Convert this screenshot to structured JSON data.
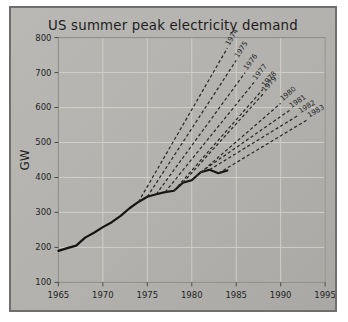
{
  "figure": {
    "title": "US summer peak electricity demand",
    "background_color": "#b5b4b0",
    "border_color": "#6f6f6d"
  },
  "chart_data": {
    "type": "line",
    "title": "US summer peak electricity demand",
    "xlabel": "",
    "ylabel": "GW",
    "xlim": [
      1965,
      1995
    ],
    "ylim": [
      100,
      800
    ],
    "xticks": [
      "1965",
      "1970",
      "1975",
      "1980",
      "1985",
      "1990",
      "1995"
    ],
    "yticks": [
      "100",
      "200",
      "300",
      "400",
      "500",
      "600",
      "700",
      "800"
    ],
    "grid": true,
    "legend": "none",
    "series": [
      {
        "name": "Actual demand",
        "style": "solid",
        "x": [
          1965,
          1966,
          1967,
          1968,
          1969,
          1970,
          1971,
          1972,
          1973,
          1974,
          1975,
          1976,
          1977,
          1978,
          1979,
          1980,
          1981,
          1982,
          1983,
          1984
        ],
        "values": [
          190,
          198,
          205,
          228,
          242,
          258,
          272,
          290,
          312,
          330,
          345,
          352,
          358,
          362,
          385,
          392,
          415,
          422,
          412,
          420
        ]
      },
      {
        "name": "1974 forecast",
        "style": "dashed",
        "label": "1974",
        "x": [
          1974,
          1984
        ],
        "values": [
          330,
          770
        ]
      },
      {
        "name": "1975 forecast",
        "style": "dashed",
        "label": "1975",
        "x": [
          1975,
          1985
        ],
        "values": [
          345,
          735
        ]
      },
      {
        "name": "1976 forecast",
        "style": "dashed",
        "label": "1976",
        "x": [
          1976,
          1986
        ],
        "values": [
          352,
          700
        ]
      },
      {
        "name": "1977 forecast",
        "style": "dashed",
        "label": "1977",
        "x": [
          1977,
          1987
        ],
        "values": [
          358,
          672
        ]
      },
      {
        "name": "1978 forecast",
        "style": "dashed",
        "label": "1978",
        "x": [
          1978,
          1988
        ],
        "values": [
          362,
          652
        ]
      },
      {
        "name": "1979 forecast",
        "style": "dashed",
        "label": "1979",
        "x": [
          1979,
          1988
        ],
        "values": [
          385,
          638
        ]
      },
      {
        "name": "1980 forecast",
        "style": "dashed",
        "label": "1980",
        "x": [
          1980,
          1990
        ],
        "values": [
          392,
          612
        ]
      },
      {
        "name": "1981 forecast",
        "style": "dashed",
        "label": "1981",
        "x": [
          1981,
          1991
        ],
        "values": [
          415,
          592
        ]
      },
      {
        "name": "1982 forecast",
        "style": "dashed",
        "label": "1982",
        "x": [
          1982,
          1992
        ],
        "values": [
          422,
          578
        ]
      },
      {
        "name": "1983 forecast",
        "style": "dashed",
        "label": "1983",
        "x": [
          1983,
          1993
        ],
        "values": [
          412,
          565
        ]
      }
    ]
  }
}
